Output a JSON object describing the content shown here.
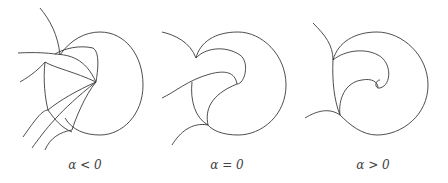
{
  "figure": {
    "panels": [
      {
        "label": "α < 0",
        "description": "phase portrait with homoclinic-like loop, multiple trajectories entering from left"
      },
      {
        "label": "α = 0",
        "description": "phase portrait at bifurcation"
      },
      {
        "label": "α > 0",
        "description": "phase portrait after bifurcation"
      }
    ],
    "stroke_color": "#3a3a3a",
    "background": "#ffffff"
  }
}
